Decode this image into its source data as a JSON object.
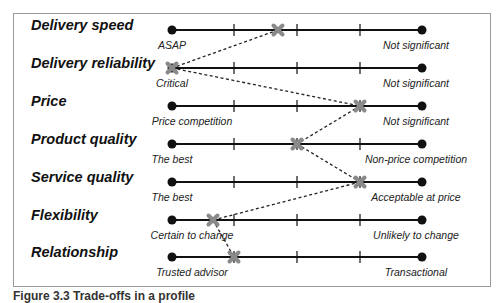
{
  "diagram": {
    "scale": {
      "x_start": 172,
      "ticks": [
        234,
        297,
        360
      ],
      "x_end": 422
    },
    "rows": [
      {
        "label": "Delivery speed",
        "left_pole": "ASAP",
        "right_pole": "Not significant",
        "marker_x": 278,
        "y": 30
      },
      {
        "label": "Delivery reliability",
        "left_pole": "Critical",
        "right_pole": "Not significant",
        "marker_x": 172,
        "y": 68
      },
      {
        "label": "Price",
        "left_pole": "Price competition",
        "right_pole": "Not significant",
        "marker_x": 360,
        "y": 106
      },
      {
        "label": "Product quality",
        "left_pole": "The best",
        "right_pole": "Non-price competition",
        "marker_x": 297,
        "y": 144
      },
      {
        "label": "Service quality",
        "left_pole": "The best",
        "right_pole": "Acceptable at price",
        "marker_x": 360,
        "y": 182
      },
      {
        "label": "Flexibility",
        "left_pole": "Certain to change",
        "right_pole": "Unlikely to change",
        "marker_x": 213,
        "y": 220
      },
      {
        "label": "Relationship",
        "left_pole": "Trusted advisor",
        "right_pole": "Transactional",
        "marker_x": 234,
        "y": 257
      }
    ],
    "colors": {
      "line": "#111111",
      "marker": "#8a8a8a",
      "connector": "#222222",
      "frame": "#9a9a9a"
    }
  },
  "caption": "Figure 3.3 Trade-offs in a profile"
}
